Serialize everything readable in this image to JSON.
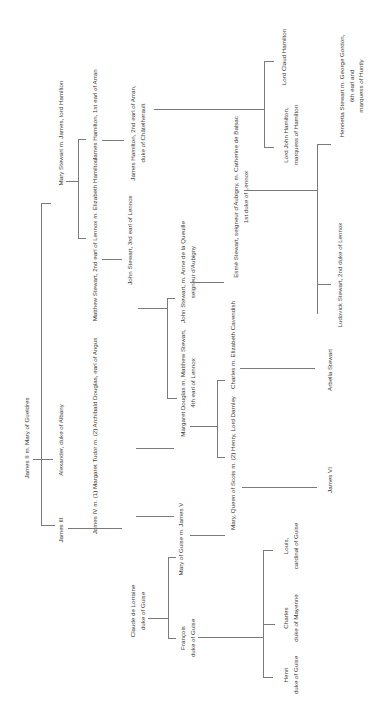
{
  "diagram": {
    "orientation": "rotated 90 degrees counter-clockwise (text reads bottom-to-top)",
    "nodes": {
      "james_ii": {
        "lines": [
          "James II m. Mary of Gueldres"
        ]
      },
      "mary_stewart": {
        "lines": [
          "Mary Stewart m. James, lord Hamilton"
        ]
      },
      "alexander": {
        "lines": [
          "Alexander,  duke of Albany"
        ]
      },
      "james_iii": {
        "lines": [
          "James III"
        ]
      },
      "james_hamilton_1": {
        "lines": [
          "James Hamilton, 1st earl of Arran"
        ]
      },
      "matthew_stewart_2": {
        "lines": [
          "Matthew Stewart, 2nd earl of Lennox m. Elizabeth Hamilton"
        ]
      },
      "james_iv": {
        "lines": [
          "James IV m. (1) Margaret Tudor m. (2) Archibald Douglas, earl of Angus"
        ]
      },
      "claude": {
        "lines": [
          "Claude de Lorraine",
          "duke of Guise"
        ]
      },
      "james_hamilton_2": {
        "lines": [
          "James Hamilton, 2nd earl of Arran,",
          "duke of Châtelherault"
        ]
      },
      "john_stewart_3": {
        "lines": [
          "John Stewart, 3rd earl of Lennox"
        ]
      },
      "margaret_douglas": {
        "lines": [
          "Margaret Douglas m. Matthew Stewart,",
          "4th earl of Lennox"
        ]
      },
      "mary_of_guise": {
        "lines": [
          "Mary of Guise m. James V"
        ]
      },
      "francois": {
        "lines": [
          "François",
          "duke of Guise"
        ]
      },
      "john_stewart_aubigny": {
        "lines": [
          "John Stewart, m. Anne de la Queuille",
          "seigneur d'Aubigny"
        ]
      },
      "esme_stewart": {
        "lines": [
          "Esmé Stewart, seigneur d'Aubigny, m. Catherine de Balsac",
          "1st duke of Lennox"
        ]
      },
      "charles_cavendish": {
        "lines": [
          "Charles m. Elizabeth Cavendish"
        ]
      },
      "henry_darnley": {
        "lines": [
          "Mary, Queen of Scots m. (2) Henry, Lord Darnley"
        ]
      },
      "louis": {
        "lines": [
          "Louis,",
          "cardinal of Guise"
        ]
      },
      "charles_mayenne": {
        "lines": [
          "Charles",
          "duke of Mayenne"
        ]
      },
      "henri": {
        "lines": [
          "Henri",
          "duke of Guise"
        ]
      },
      "lord_john_hamilton": {
        "lines": [
          "Lord John Hamilton,",
          "marquess of Hamilton"
        ]
      },
      "lord_claud_hamilton": {
        "lines": [
          "Lord Claud Hamilton"
        ]
      },
      "henrietta": {
        "lines": [
          "Henrietta Stewart m. George Gordon,",
          "6th earl and",
          "marquess of Huntly"
        ]
      },
      "ludovick": {
        "lines": [
          "Ludovick Stewart, 2nd duke of Lennox"
        ]
      },
      "arbella": {
        "lines": [
          "Arbella Stewart"
        ]
      },
      "james_vi": {
        "lines": [
          "James VI"
        ]
      }
    }
  }
}
